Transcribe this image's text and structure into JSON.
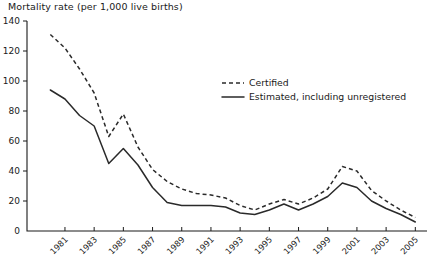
{
  "chart_data": {
    "type": "line",
    "title": "Mortality rate (per 1,000 live births)",
    "xlabel": "",
    "ylabel": "Mortality rate (per 1,000 live births)",
    "xlim": [
      1978.4,
      2005.8
    ],
    "ylim": [
      0,
      140
    ],
    "ytick_values": [
      0,
      20,
      40,
      60,
      80,
      100,
      120,
      140
    ],
    "ytick_labels": [
      "0",
      "20",
      "40",
      "60",
      "80",
      "100",
      "120",
      "140"
    ],
    "xtick_values": [
      1981,
      1983,
      1985,
      1987,
      1989,
      1991,
      1993,
      1995,
      1997,
      1999,
      2001,
      2003,
      2005
    ],
    "xtick_labels": [
      "1981",
      "1983",
      "1985",
      "1987",
      "1989",
      "1991",
      "1993",
      "1995",
      "1997",
      "1999",
      "2001",
      "2003",
      "2005"
    ],
    "grid": false,
    "legend_position": "upper-right",
    "x": [
      1980,
      1981,
      1982,
      1983,
      1984,
      1985,
      1986,
      1987,
      1988,
      1989,
      1990,
      1991,
      1992,
      1993,
      1994,
      1995,
      1996,
      1997,
      1998,
      1999,
      2000,
      2001,
      2002,
      2003,
      2004,
      2005
    ],
    "series": [
      {
        "name": "Certified",
        "style": "dashed",
        "values": [
          131,
          122,
          108,
          92,
          63,
          78,
          56,
          41,
          33,
          28,
          25,
          24,
          22,
          17,
          14,
          18,
          21,
          18,
          22,
          28,
          43,
          40,
          27,
          20,
          14,
          9
        ]
      },
      {
        "name": "Estimated, including unregistered",
        "style": "solid",
        "values": [
          94,
          88,
          77,
          70,
          45,
          55,
          44,
          29,
          19,
          17,
          17,
          17,
          16,
          12,
          11,
          14,
          18,
          14,
          18,
          23,
          32,
          29,
          20,
          15,
          11,
          6
        ]
      }
    ]
  },
  "legend": {
    "items": [
      {
        "label": "Certified",
        "style": "dashed"
      },
      {
        "label": "Estimated, including unregistered",
        "style": "solid"
      }
    ]
  }
}
